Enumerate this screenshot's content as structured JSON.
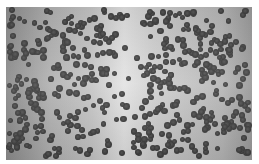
{
  "image": {
    "description": "Grayscale micrograph of scattered dark circular particles on a light gradient background",
    "background_colors": {
      "edge": "#8e8e8e",
      "center": "#e4e4e4"
    },
    "particle_color": "#444444",
    "particle_diameter_px": 6,
    "particle_count_approx": 520
  }
}
